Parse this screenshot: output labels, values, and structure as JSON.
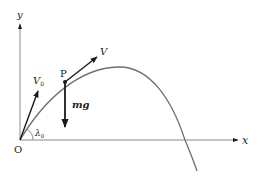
{
  "diagram": {
    "colors": {
      "axis": "#8a8a8a",
      "curve": "#6f6f6f",
      "vector": "#1a1a1a",
      "text": "#222222",
      "background": "#ffffff"
    },
    "axes": {
      "x_label": "x",
      "y_label": "y",
      "origin_label": "O"
    },
    "point": {
      "label": "P"
    },
    "vectors": {
      "initial_velocity": {
        "label": "V",
        "subscript": "0"
      },
      "velocity": {
        "label": "V"
      },
      "gravity": {
        "label": "mg"
      }
    },
    "angle": {
      "label": "λ",
      "subscript": "0"
    }
  }
}
